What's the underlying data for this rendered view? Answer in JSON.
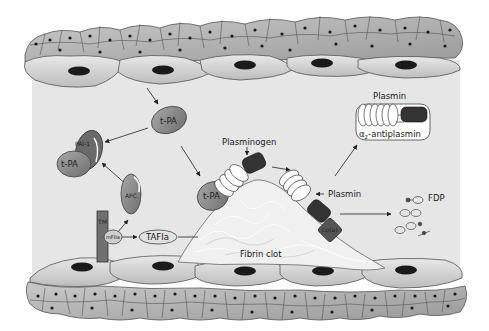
{
  "diagram": {
    "colors": {
      "lumen": "#e6e6e6",
      "cell_fill": "#d4d4d4",
      "cell_stroke": "#555555",
      "nucleus": "#1a1a1a",
      "enzyme_gray": "#8c8c8c",
      "dark_block": "#333333",
      "clot": "#f0f0f0"
    },
    "labels": {
      "tpa_free": "t-PA",
      "pai1": "PAI-1",
      "tpa_bound_pai": "t-PA",
      "apc": "APC",
      "tm": "TM",
      "thrombin": "mFIIa",
      "tafia": "TAFIa",
      "plasminogen": "Plasminogen",
      "tpa_on_clot": "t-PA",
      "plasmin_mid": "Plasmin",
      "plasmin_top": "Plasmin",
      "antiplasmin_prefix": "α",
      "antiplasmin_sub": "2",
      "antiplasmin_suffix": "-antiplasmin",
      "lpa": "Lp(a)",
      "fdp": "FDP",
      "fibrin_clot": "Fibrin clot"
    }
  }
}
